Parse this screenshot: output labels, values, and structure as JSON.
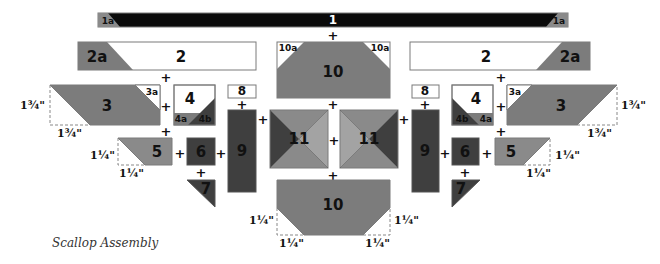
{
  "caption": "Scallop Assembly",
  "colors": {
    "black": "#0b0b0b",
    "dark": "#3f3f3f",
    "medium": "#7c7c7c",
    "light": "#a3a3a3",
    "white": "#ffffff",
    "outline": "#7a7a7a"
  },
  "pieces": {
    "p1": "1",
    "p1a_left": "1a",
    "p1a_right": "1a",
    "p2_left": "2",
    "p2a_left": "2a",
    "p2_right": "2",
    "p2a_right": "2a",
    "p10_top": "10",
    "p10a_left": "10a",
    "p10a_right": "10a",
    "p3_left": "3",
    "p3a_left": "3a",
    "p3_right": "3",
    "p3a_right": "3a",
    "p4_left": "4",
    "p4a_left": "4a",
    "p4b_left": "4b",
    "p4_right": "4",
    "p4a_right": "4a",
    "p4b_right": "4b",
    "p8_left": "8",
    "p8_right": "8",
    "p9_left": "9",
    "p9_right": "9",
    "p11_left": "11",
    "p11_right": "11",
    "p5_left": "5",
    "p5_right": "5",
    "p6_left": "6",
    "p6_right": "6",
    "p7_left": "7",
    "p7_right": "7",
    "p10_bottom": "10"
  },
  "join_symbol": "+",
  "measurements": {
    "p3_left_height": "1¾\"",
    "p3_left_width": "1¾\"",
    "p3_right_height": "1¾\"",
    "p3_right_width": "1¾\"",
    "p5_left_height": "1¼\"",
    "p5_left_width": "1¼\"",
    "p5_right_height": "1¼\"",
    "p5_right_width": "1¼\"",
    "p10_bottom_left_height": "1¼\"",
    "p10_bottom_left_width": "1¼\"",
    "p10_bottom_right_height": "1¼\"",
    "p10_bottom_right_width": "1¼\""
  }
}
